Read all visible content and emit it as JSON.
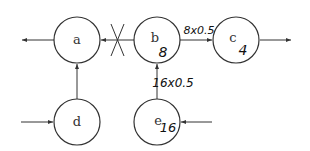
{
  "diagram": {
    "nodes": [
      {
        "id": "a",
        "label": "a",
        "value": ""
      },
      {
        "id": "b",
        "label": "b",
        "value": "8"
      },
      {
        "id": "c",
        "label": "c",
        "value": "4"
      },
      {
        "id": "d",
        "label": "d",
        "value": ""
      },
      {
        "id": "e",
        "label": "e",
        "value": "16"
      }
    ],
    "edges": [
      {
        "from": "b",
        "to": "a",
        "label": "",
        "blocked": true
      },
      {
        "from": "b",
        "to": "c",
        "label": "8x0.5"
      },
      {
        "from": "d",
        "to": "a",
        "label": ""
      },
      {
        "from": "e",
        "to": "b",
        "label": "16x0.5"
      },
      {
        "from": "a",
        "to": "out-left",
        "label": ""
      },
      {
        "from": "c",
        "to": "out-right",
        "label": ""
      },
      {
        "from": "in-left",
        "to": "d",
        "label": ""
      },
      {
        "from": "in-right",
        "to": "e",
        "label": ""
      }
    ],
    "annotations": {
      "b_to_c": "8x0.5",
      "e_to_b": "16x0.5",
      "blocked_mark": "X"
    },
    "colors": {
      "stroke": "#333333",
      "background": "#ffffff"
    }
  }
}
